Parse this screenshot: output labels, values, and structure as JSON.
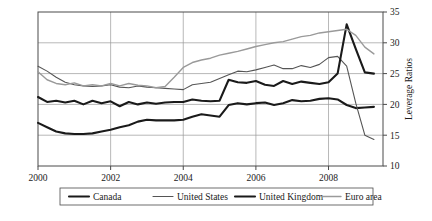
{
  "chart_data": {
    "type": "line",
    "title": "",
    "xlabel": "",
    "ylabel": "Leverage Ratios",
    "xlim": [
      2000.0,
      2009.5
    ],
    "ylim": [
      10,
      35
    ],
    "xticks": [
      "2000",
      "2002",
      "2004",
      "2006",
      "2008"
    ],
    "xtick_values": [
      2000,
      2002,
      2004,
      2006,
      2008
    ],
    "yticks": [
      "10",
      "15",
      "20",
      "25",
      "30",
      "35"
    ],
    "ytick_values": [
      10,
      15,
      20,
      25,
      30,
      35
    ],
    "grid": "both",
    "legend_position": "below",
    "y_axis_side": "right",
    "x": [
      2000.0,
      2000.25,
      2000.5,
      2000.75,
      2001.0,
      2001.25,
      2001.5,
      2001.75,
      2002.0,
      2002.25,
      2002.5,
      2002.75,
      2003.0,
      2003.25,
      2003.5,
      2003.75,
      2004.0,
      2004.25,
      2004.5,
      2004.75,
      2005.0,
      2005.25,
      2005.5,
      2005.75,
      2006.0,
      2006.25,
      2006.5,
      2006.75,
      2007.0,
      2007.25,
      2007.5,
      2007.75,
      2008.0,
      2008.25,
      2008.5,
      2008.75,
      2009.0,
      2009.25
    ],
    "series": [
      {
        "name": "Canada",
        "color": "#1a1a1a",
        "width": 2.1,
        "values": [
          17.0,
          16.3,
          15.6,
          15.3,
          15.2,
          15.2,
          15.3,
          15.6,
          15.9,
          16.3,
          16.6,
          17.2,
          17.5,
          17.4,
          17.4,
          17.4,
          17.5,
          18.0,
          18.4,
          18.2,
          18.0,
          19.9,
          20.2,
          20.0,
          20.2,
          20.3,
          19.9,
          20.2,
          20.7,
          20.5,
          20.6,
          20.9,
          21.0,
          20.8,
          19.9,
          19.4,
          19.5,
          19.6
        ]
      },
      {
        "name": "United States",
        "color": "#555555",
        "width": 1.1,
        "values": [
          26.2,
          25.4,
          24.4,
          23.6,
          23.2,
          23.0,
          22.9,
          23.0,
          23.2,
          22.8,
          22.7,
          23.0,
          22.8,
          22.7,
          22.6,
          22.5,
          22.4,
          23.2,
          23.4,
          23.6,
          24.2,
          24.8,
          25.4,
          25.3,
          25.6,
          26.0,
          26.4,
          25.8,
          25.8,
          26.3,
          26.0,
          26.5,
          27.6,
          27.8,
          26.2,
          20.2,
          15.0,
          14.3
        ]
      },
      {
        "name": "United Kingdom",
        "color": "#1a1a1a",
        "width": 2.1,
        "values": [
          21.2,
          20.4,
          20.6,
          20.3,
          20.6,
          20.0,
          20.6,
          20.2,
          20.5,
          19.7,
          20.4,
          20.0,
          20.3,
          20.1,
          20.3,
          20.4,
          20.4,
          20.8,
          20.6,
          20.5,
          20.6,
          24.0,
          23.6,
          23.5,
          23.8,
          23.2,
          23.0,
          23.8,
          23.3,
          23.7,
          23.5,
          23.3,
          23.6,
          25.0,
          33.0,
          29.0,
          25.2,
          25.0
        ]
      },
      {
        "name": "Euro area",
        "color": "#9a9a9a",
        "width": 1.4,
        "values": [
          25.3,
          24.0,
          23.4,
          23.2,
          23.5,
          23.0,
          23.2,
          23.0,
          23.4,
          23.0,
          23.4,
          23.1,
          23.0,
          22.7,
          22.9,
          24.4,
          26.0,
          26.8,
          27.2,
          27.5,
          28.0,
          28.3,
          28.6,
          29.0,
          29.4,
          29.7,
          30.0,
          30.2,
          30.6,
          31.0,
          31.2,
          31.6,
          31.8,
          32.0,
          32.2,
          31.2,
          29.3,
          28.2
        ]
      }
    ]
  },
  "legend": {
    "items": [
      {
        "label": "Canada"
      },
      {
        "label": "United States"
      },
      {
        "label": "United Kingdom"
      },
      {
        "label": "Euro area"
      }
    ]
  }
}
